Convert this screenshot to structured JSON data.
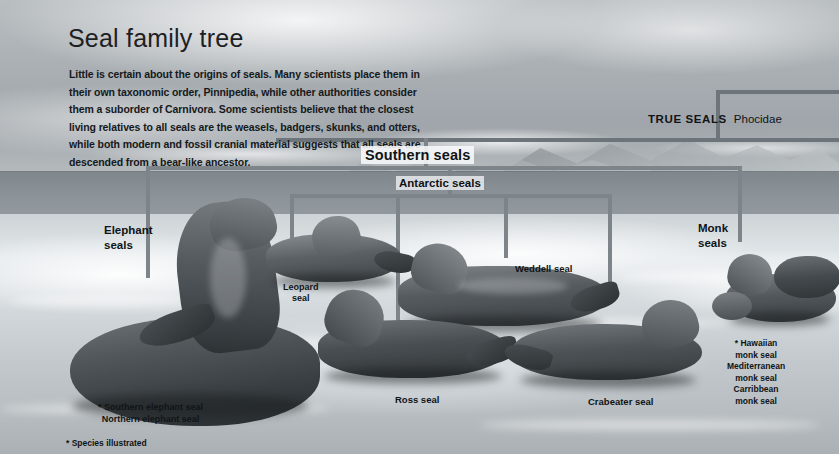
{
  "document": {
    "title": "Seal family tree",
    "intro": "Little is certain about the origins of seals. Many scientists place them in their own taxonomic order, Pinnipedia, while other authorities consider them a suborder of Carnivora. Some scientists believe that the closest living relatives to all seals are the weasels, badgers, skunks, and otters, while both modern and fossil cranial material suggests that all seals are descended from a bear-like ancestor.",
    "footnote": "* Species illustrated"
  },
  "taxonomy": {
    "root_label": "TRUE SEALS",
    "root_family": "Phocidae",
    "group_southern": "Southern seals",
    "group_antarctic": "Antarctic seals",
    "group_elephant": "Elephant\nseals",
    "group_elephant_line1": "Elephant",
    "group_elephant_line2": "seals",
    "group_monk_line1": "Monk",
    "group_monk_line2": "seals"
  },
  "species": {
    "leopard_line1": "Leopard",
    "leopard_line2": "seal",
    "weddell": "Weddell seal",
    "ross": "Ross seal",
    "crabeater": "Crabeater seal",
    "elephant_list": [
      "* Southern elephant seal",
      "Northern elephant seal"
    ],
    "monk_list": [
      "*  Hawaiian",
      "monk seal",
      "Mediterranean",
      "monk seal",
      "Carribbean",
      "monk seal"
    ]
  },
  "colors": {
    "line": "#7d848a",
    "text": "#101417",
    "sky": "#a8aeb2",
    "ice": "#d2d8db",
    "sea": "#8b9298"
  }
}
